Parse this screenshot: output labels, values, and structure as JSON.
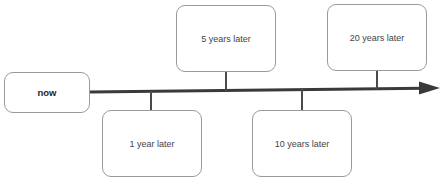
{
  "timeline": {
    "start": {
      "label": "now"
    },
    "milestones": [
      {
        "label": "1 year later",
        "position": "below"
      },
      {
        "label": "5 years later",
        "position": "above"
      },
      {
        "label": "10 years later",
        "position": "below"
      },
      {
        "label": "20 years later",
        "position": "above"
      }
    ]
  },
  "colors": {
    "axis": "#3a3a3a",
    "box_border": "#9a9a9a",
    "text": "#444444"
  }
}
